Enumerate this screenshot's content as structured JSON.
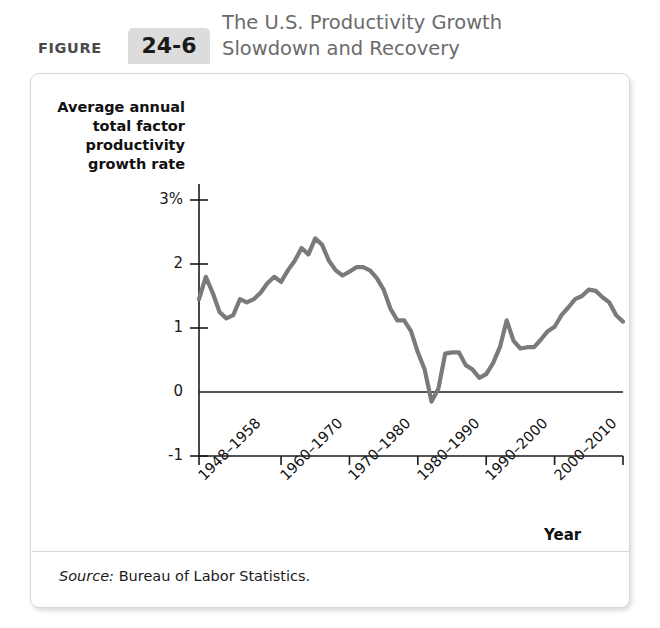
{
  "figure": {
    "label_word": "FIGURE",
    "number": "24-6",
    "title_line1": "The U.S. Productivity Growth",
    "title_line2": "Slowdown and Recovery",
    "source_prefix": "Source:",
    "source_text": "Bureau of Labor Statistics.",
    "accent_box_color": "#dcdcdc",
    "title_color": "#6b6b6b"
  },
  "chart_data": {
    "type": "line",
    "title": "The U.S. Productivity Growth Slowdown and Recovery",
    "xlabel": "Year",
    "ylabel": "Average annual total factor productivity growth rate",
    "ylabel_lines": [
      "Average annual",
      "total factor",
      "productivity",
      "growth rate"
    ],
    "line_color": "#7a7a7a",
    "axis_color": "#1a1a1a",
    "grid": false,
    "legend": "none",
    "ylim": [
      -1,
      3.25
    ],
    "yticks": [
      -1,
      0,
      1,
      2,
      3
    ],
    "ytick_labels": [
      "-1",
      "0",
      "1",
      "2",
      "3%"
    ],
    "xlim": [
      1948,
      2010
    ],
    "xtick_values": [
      1948,
      1960,
      1970,
      1980,
      1990,
      2000,
      2010
    ],
    "xtick_labels": [
      "1948–1958",
      "1960–1970",
      "1970–1980",
      "1980–1990",
      "1990–2000",
      "2000–2010"
    ],
    "x": [
      1948,
      1949,
      1950,
      1951,
      1952,
      1953,
      1954,
      1955,
      1956,
      1957,
      1958,
      1959,
      1960,
      1961,
      1962,
      1963,
      1964,
      1965,
      1966,
      1967,
      1968,
      1969,
      1970,
      1971,
      1972,
      1973,
      1974,
      1975,
      1976,
      1977,
      1978,
      1979,
      1980,
      1981,
      1982,
      1983,
      1984,
      1985,
      1986,
      1987,
      1988,
      1989,
      1990,
      1991,
      1992,
      1993,
      1994,
      1995,
      1996,
      1997,
      1998,
      1999,
      2000,
      2001,
      2002,
      2003,
      2004,
      2005,
      2006,
      2007,
      2008,
      2009,
      2010
    ],
    "values": [
      1.45,
      1.8,
      1.55,
      1.25,
      1.15,
      1.2,
      1.45,
      1.4,
      1.45,
      1.55,
      1.7,
      1.8,
      1.72,
      1.9,
      2.05,
      2.25,
      2.15,
      2.4,
      2.3,
      2.05,
      1.9,
      1.82,
      1.88,
      1.95,
      1.95,
      1.9,
      1.78,
      1.6,
      1.3,
      1.12,
      1.12,
      0.95,
      0.62,
      0.35,
      -0.15,
      0.05,
      0.6,
      0.62,
      0.62,
      0.42,
      0.35,
      0.22,
      0.28,
      0.45,
      0.7,
      1.12,
      0.8,
      0.68,
      0.7,
      0.7,
      0.82,
      0.95,
      1.02,
      1.2,
      1.32,
      1.45,
      1.5,
      1.6,
      1.58,
      1.48,
      1.4,
      1.2,
      1.1
    ],
    "zero_line": true
  },
  "y_tick_positions_note": null
}
